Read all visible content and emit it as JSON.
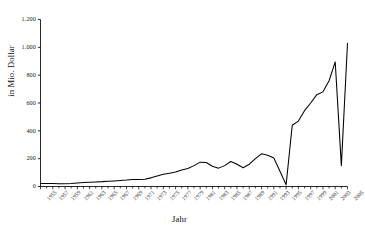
{
  "chart_data": {
    "type": "line",
    "title": "",
    "xlabel": "Jahr",
    "ylabel": "in Mio. Dollar",
    "xlim": [
      1955,
      2005
    ],
    "ylim": [
      0,
      1200
    ],
    "grid": false,
    "legend": false,
    "legend_position": "none",
    "line_color": "#000000",
    "y_ticks": [
      0,
      200,
      400,
      600,
      800,
      1000,
      1200
    ],
    "y_tick_labels": [
      "0",
      "200",
      "400",
      "600",
      "800",
      "1.000",
      "1.200"
    ],
    "x_tick_labels": [
      "1955",
      "1957",
      "1959",
      "1961",
      "1963",
      "1965",
      "1967",
      "1969",
      "1971",
      "1973",
      "1975",
      "1977",
      "1979",
      "1981",
      "1983",
      "1985",
      "1987",
      "1989",
      "1991",
      "1993",
      "1995",
      "1997",
      "1999",
      "2001",
      "2003",
      "2005"
    ],
    "x_tick_label_step_years": 2,
    "x_minor_tick_step_years": 1,
    "x": [
      1955,
      1956,
      1957,
      1958,
      1959,
      1960,
      1961,
      1962,
      1963,
      1964,
      1965,
      1966,
      1967,
      1968,
      1969,
      1970,
      1971,
      1972,
      1973,
      1974,
      1975,
      1976,
      1977,
      1978,
      1979,
      1980,
      1981,
      1982,
      1983,
      1984,
      1985,
      1986,
      1987,
      1988,
      1989,
      1990,
      1991,
      1992,
      1993,
      1994,
      1995,
      1996,
      1997,
      1998,
      1999,
      2000,
      2001,
      2002,
      2003,
      2004,
      2005
    ],
    "values": [
      22,
      22,
      21,
      20,
      20,
      22,
      25,
      28,
      30,
      33,
      35,
      38,
      40,
      43,
      46,
      50,
      50,
      52,
      62,
      75,
      88,
      95,
      105,
      118,
      130,
      150,
      175,
      172,
      145,
      132,
      150,
      180,
      160,
      135,
      160,
      200,
      235,
      225,
      205,
      110,
      12,
      440,
      470,
      545,
      600,
      660,
      680,
      760,
      895,
      150,
      1030
    ],
    "series": [
      {
        "name": "in Mio. Dollar",
        "values": [
          22,
          22,
          21,
          20,
          20,
          22,
          25,
          28,
          30,
          33,
          35,
          38,
          40,
          43,
          46,
          50,
          50,
          52,
          62,
          75,
          88,
          95,
          105,
          118,
          130,
          150,
          175,
          172,
          145,
          132,
          150,
          180,
          160,
          135,
          160,
          200,
          235,
          225,
          205,
          110,
          12,
          440,
          470,
          545,
          600,
          660,
          680,
          760,
          895,
          150,
          1030
        ]
      }
    ]
  },
  "axes": {
    "y_title": "in Mio. Dollar",
    "x_title": "Jahr"
  }
}
